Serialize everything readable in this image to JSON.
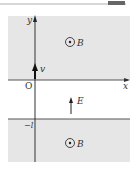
{
  "figure": {
    "type": "physics-field-diagram",
    "axes": {
      "x_label": "x",
      "y_label": "y",
      "origin_label": "O"
    },
    "regions": [
      {
        "name": "upper-magnetic-region",
        "field_label": "B",
        "field_symbol": "out-of-page (⊙)",
        "color": "#e6e6e6"
      },
      {
        "name": "electric-field-region",
        "field_label": "E",
        "field_direction": "+y"
      },
      {
        "name": "lower-magnetic-region",
        "field_label": "B",
        "field_symbol": "out-of-page (⊙)",
        "boundary_label": "−l",
        "color": "#e6e6e6"
      }
    ],
    "particle_velocity_label": "v",
    "colors": {
      "shade": "#e6e6e6",
      "line": "#555555",
      "ink": "#222222"
    }
  },
  "labels": {
    "x": "x",
    "y": "y",
    "origin": "O",
    "v": "v",
    "E": "E",
    "B_upper": "B",
    "B_lower": "B",
    "minus_l": "−l"
  }
}
